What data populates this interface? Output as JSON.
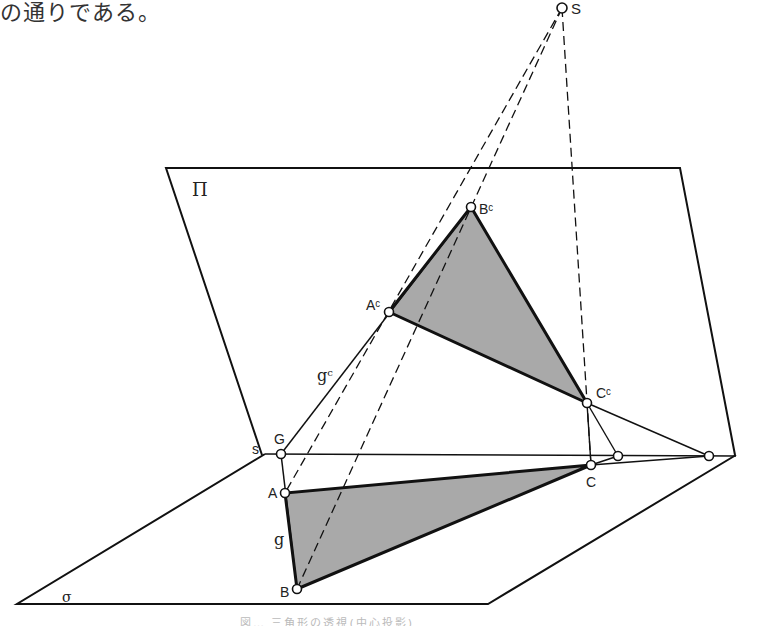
{
  "intro_text": "の通りである。",
  "caption_partial": "図… 三角形の透視(中心投影)",
  "planes": {
    "picture_plane": {
      "label": "Π",
      "polygon": [
        [
          166,
          168
        ],
        [
          680,
          168
        ],
        [
          735,
          455
        ],
        [
          262,
          455
        ]
      ]
    },
    "ground_plane": {
      "label": "σ",
      "polygon": [
        [
          17,
          604
        ],
        [
          488,
          604
        ],
        [
          736,
          455
        ],
        [
          265,
          454
        ]
      ]
    }
  },
  "center": {
    "label": "S",
    "x": 562,
    "y": 8
  },
  "points": {
    "A": {
      "label": "A",
      "x": 285,
      "y": 493
    },
    "B": {
      "label": "B",
      "x": 297,
      "y": 589
    },
    "C": {
      "label": "C",
      "x": 591,
      "y": 465
    },
    "Ac": {
      "label": "Aᶜ",
      "x": 389,
      "y": 312
    },
    "Bc": {
      "label": "Bᶜ",
      "x": 471,
      "y": 207
    },
    "Cc": {
      "label": "Cᶜ",
      "x": 587,
      "y": 403
    },
    "G": {
      "label": "G",
      "x": 281,
      "y": 454
    },
    "P1": {
      "x": 618,
      "y": 456
    },
    "P2": {
      "x": 709,
      "y": 456
    }
  },
  "labels": {
    "s": "s",
    "g": "g",
    "gc": "gᶜ",
    "sigma": "σ",
    "pi": "Π"
  },
  "colors": {
    "line": "#111111",
    "fill": "#a9a9a9",
    "background": "#ffffff"
  }
}
